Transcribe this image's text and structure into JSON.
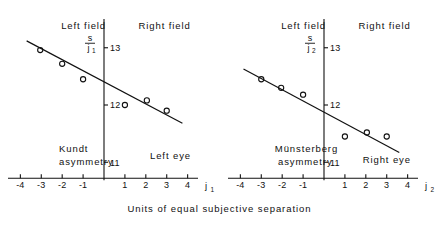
{
  "figure": {
    "caption": "Units of equal subjective separation"
  },
  "chart_data": [
    {
      "type": "scatter",
      "panel": "left",
      "title": "",
      "xlabel": "j₁",
      "ylabel": "s/j₁",
      "ylabel_numerator": "s",
      "ylabel_denominator": "j",
      "ylabel_denominator_sub": "1",
      "xlim": [
        -4.4,
        4.4
      ],
      "ylim": [
        10.55,
        13.45
      ],
      "xticks": [
        -4,
        -3,
        -2,
        -1,
        1,
        2,
        3,
        4
      ],
      "xticklabels": [
        "-4",
        "-3",
        "-2",
        "-1",
        "1",
        "2",
        "3",
        "4"
      ],
      "yticks": [
        11,
        12,
        13
      ],
      "yticklabels": [
        "11",
        "12",
        "13"
      ],
      "grid": false,
      "legend": "none",
      "x": [
        -3.05,
        -2.0,
        -1.0,
        1.0,
        2.05,
        3.0
      ],
      "y": [
        12.96,
        12.72,
        12.45,
        12.0,
        12.08,
        11.9
      ],
      "fit_line": {
        "x": [
          -3.7,
          3.75
        ],
        "y": [
          13.12,
          11.68
        ]
      },
      "annotations": [
        {
          "text": "Left field",
          "x": -2.05,
          "y": 13.33
        },
        {
          "text": "Right field",
          "x": 1.65,
          "y": 13.33
        },
        {
          "text": "Kundt",
          "x": -2.15,
          "y": 11.18
        },
        {
          "text": "asymmetry",
          "x": -2.15,
          "y": 10.96
        },
        {
          "text": "Left eye",
          "x": 2.2,
          "y": 11.05
        }
      ]
    },
    {
      "type": "scatter",
      "panel": "right",
      "title": "",
      "xlabel": "j₂",
      "ylabel": "s/j₂",
      "ylabel_numerator": "s",
      "ylabel_denominator": "j",
      "ylabel_denominator_sub": "2",
      "xlim": [
        -4.4,
        4.4
      ],
      "ylim": [
        10.55,
        13.45
      ],
      "xticks": [
        -4,
        -3,
        -2,
        -1,
        1,
        2,
        3,
        4
      ],
      "xticklabels": [
        "-4",
        "-3",
        "-2",
        "-1",
        "1",
        "2",
        "3",
        "4"
      ],
      "yticks": [
        11,
        12,
        13
      ],
      "yticklabels": [
        "11",
        "12",
        "13"
      ],
      "grid": false,
      "legend": "none",
      "x": [
        -3.0,
        -2.05,
        -1.0,
        1.0,
        2.05,
        3.0
      ],
      "y": [
        12.45,
        12.3,
        12.18,
        11.45,
        11.52,
        11.45
      ],
      "fit_line": {
        "x": [
          -3.85,
          3.6
        ],
        "y": [
          12.63,
          11.17
        ]
      },
      "annotations": [
        {
          "text": "Left field",
          "x": -2.05,
          "y": 13.33
        },
        {
          "text": "Right field",
          "x": 1.65,
          "y": 13.33
        },
        {
          "text": "Münsterberg",
          "x": -2.35,
          "y": 11.18
        },
        {
          "text": "asymmetry",
          "x": -2.2,
          "y": 10.96
        },
        {
          "text": "Right eye",
          "x": 1.85,
          "y": 10.99
        }
      ]
    }
  ]
}
